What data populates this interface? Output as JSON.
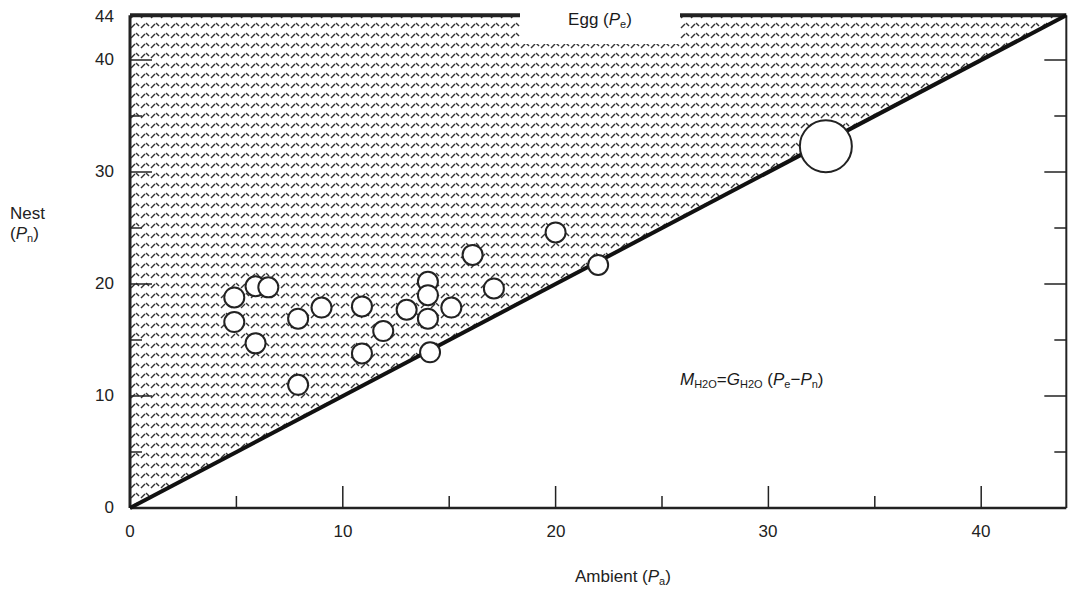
{
  "chart_data": {
    "type": "scatter",
    "title": "",
    "xlabel": "Ambient (Pa)",
    "ylabel": "Nest (Pn)",
    "top_label": "Egg (Pe)",
    "annotation": "M_H2O = G_H2O (Pe − Pn)",
    "xlim": [
      0,
      44
    ],
    "ylim": [
      0,
      44
    ],
    "x_ticks": [
      0,
      10,
      20,
      30,
      40
    ],
    "y_ticks": [
      0,
      10,
      20,
      30,
      40,
      44
    ],
    "x_minor_ticks": [
      5,
      15,
      25,
      35
    ],
    "y_minor_ticks": [
      5,
      15,
      25,
      35
    ],
    "grid": false,
    "legend": null,
    "reference_line": {
      "name": "Pn = Pa (nest equals ambient)",
      "from": [
        0,
        0
      ],
      "to": [
        44,
        44
      ]
    },
    "shaded_region": "Between Pn = Pa diagonal and top line Pe = 44 (hatched)",
    "series": [
      {
        "name": "Nest vs ambient vapor pressure",
        "points": [
          {
            "x": 4.9,
            "y": 18.8
          },
          {
            "x": 4.9,
            "y": 16.6
          },
          {
            "x": 5.9,
            "y": 14.7
          },
          {
            "x": 5.9,
            "y": 19.8
          },
          {
            "x": 6.5,
            "y": 19.7
          },
          {
            "x": 7.9,
            "y": 16.9
          },
          {
            "x": 7.9,
            "y": 11.0
          },
          {
            "x": 9.0,
            "y": 17.9
          },
          {
            "x": 10.9,
            "y": 18.0
          },
          {
            "x": 10.9,
            "y": 13.8
          },
          {
            "x": 11.9,
            "y": 15.8
          },
          {
            "x": 13.0,
            "y": 17.7
          },
          {
            "x": 14.0,
            "y": 20.2
          },
          {
            "x": 14.0,
            "y": 19.0
          },
          {
            "x": 14.0,
            "y": 16.9
          },
          {
            "x": 14.1,
            "y": 13.9
          },
          {
            "x": 15.1,
            "y": 17.9
          },
          {
            "x": 16.1,
            "y": 22.6
          },
          {
            "x": 17.1,
            "y": 19.6
          },
          {
            "x": 20.0,
            "y": 24.6
          },
          {
            "x": 22.0,
            "y": 21.7
          }
        ]
      },
      {
        "name": "Large point",
        "points": [
          {
            "x": 32.7,
            "y": 32.3,
            "size": "large"
          }
        ]
      }
    ]
  },
  "labels": {
    "egg": "Egg (",
    "egg_var": "P",
    "egg_sub": "e",
    "nest": "Nest",
    "nest_paren_open": "(",
    "nest_var": "P",
    "nest_sub": "n",
    "ambient": "Ambient (",
    "ambient_var": "P",
    "ambient_sub": "a",
    "close_paren": ")",
    "formula": {
      "m": "M",
      "m_sub": "H2O",
      "eq": "=",
      "g": "G",
      "g_sub": "H2O",
      "open": " (",
      "pe": "P",
      "pe_sub": "e",
      "minus": "−",
      "pn": "P",
      "pn_sub": "n",
      "close": ")"
    },
    "y_ticks": [
      "44",
      "40",
      "30",
      "20",
      "10",
      "0"
    ],
    "x_ticks": [
      "0",
      "10",
      "20",
      "30",
      "40"
    ]
  }
}
